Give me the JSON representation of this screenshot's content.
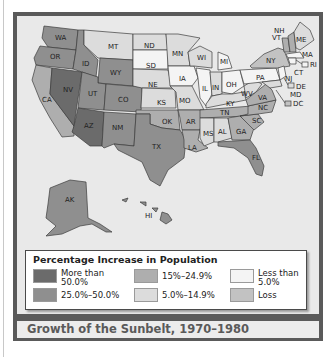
{
  "title": "Growth of the Sunbelt, 1970–1980",
  "legend": {
    "title": "Percentage Increase in Population",
    "items": [
      {
        "label": "More than 50.0%",
        "line1": "More than",
        "line2": "50.0%",
        "color": "#6b6b6b"
      },
      {
        "label": "25.0%–50.0%",
        "line1": "25.0%–50.0%",
        "line2": "",
        "color": "#8f8f8f"
      },
      {
        "label": "15%–24.9%",
        "line1": "15%–24.9%",
        "line2": "",
        "color": "#aeaeae"
      },
      {
        "label": "5.0%–14.9%",
        "line1": "5.0%–14.9%",
        "line2": "",
        "color": "#dcdcdc"
      },
      {
        "label": "Less than 5.0%",
        "line1": "Less than",
        "line2": "5.0%",
        "color": "#f4f4f4"
      },
      {
        "label": "Loss",
        "line1": "Loss",
        "line2": "",
        "color": "#c2c2c2"
      }
    ]
  },
  "states": {
    "WA": "25.0%–50.0%",
    "OR": "25.0%–50.0%",
    "CA": "15%–24.9%",
    "NV": "More than 50.0%",
    "ID": "25.0%–50.0%",
    "MT": "5.0%–14.9%",
    "WY": "25.0%–50.0%",
    "UT": "25.0%–50.0%",
    "AZ": "More than 50.0%",
    "CO": "25.0%–50.0%",
    "NM": "25.0%–50.0%",
    "ND": "5.0%–14.9%",
    "SD": "Less than 5.0%",
    "NE": "5.0%–14.9%",
    "KS": "5.0%–14.9%",
    "OK": "15%–24.9%",
    "TX": "25.0%–50.0%",
    "MN": "5.0%–14.9%",
    "IA": "Less than 5.0%",
    "MO": "5.0%–14.9%",
    "AR": "15%–24.9%",
    "LA": "15%–24.9%",
    "WI": "5.0%–14.9%",
    "IL": "Less than 5.0%",
    "MI": "Less than 5.0%",
    "IN": "5.0%–14.9%",
    "OH": "Less than 5.0%",
    "KY": "5.0%–14.9%",
    "TN": "15%–24.9%",
    "MS": "5.0%–14.9%",
    "AL": "5.0%–14.9%",
    "GA": "15%–24.9%",
    "FL": "25.0%–50.0%",
    "SC": "15%–24.9%",
    "NC": "15%–24.9%",
    "VA": "15%–24.9%",
    "WV": "5.0%–14.9%",
    "PA": "Less than 5.0%",
    "NY": "Loss",
    "VT": "15%–24.9%",
    "NH": "15%–24.9%",
    "ME": "5.0%–14.9%",
    "MA": "Less than 5.0%",
    "RI": "Less than 5.0%",
    "CT": "Less than 5.0%",
    "NJ": "Less than 5.0%",
    "DE": "5.0%–14.9%",
    "MD": "5.0%–14.9%",
    "DC": "Loss",
    "AK": "25.0%–50.0%",
    "HI": "25.0%–50.0%"
  },
  "labels": {
    "WA": "WA",
    "OR": "OR",
    "CA": "CA",
    "NV": "NV",
    "ID": "ID",
    "MT": "MT",
    "WY": "WY",
    "UT": "UT",
    "AZ": "AZ",
    "CO": "CO",
    "NM": "NM",
    "ND": "ND",
    "SD": "SD",
    "NE": "NE",
    "KS": "KS",
    "OK": "OK",
    "TX": "TX",
    "MN": "MN",
    "IA": "IA",
    "MO": "MO",
    "AR": "AR",
    "LA": "LA",
    "WI": "WI",
    "IL": "IL",
    "MI": "MI",
    "IN": "IN",
    "OH": "OH",
    "KY": "KY",
    "TN": "TN",
    "MS": "MS",
    "AL": "AL",
    "GA": "GA",
    "FL": "FL",
    "SC": "SC",
    "NC": "NC",
    "VA": "VA",
    "WV": "WV",
    "PA": "PA",
    "NY": "NY",
    "VT": "VT",
    "NH": "NH",
    "ME": "ME",
    "MA": "MA",
    "RI": "RI",
    "CT": "CT",
    "NJ": "NJ",
    "DE": "DE",
    "MD": "MD",
    "DC": "DC",
    "AK": "AK",
    "HI": "HI"
  }
}
